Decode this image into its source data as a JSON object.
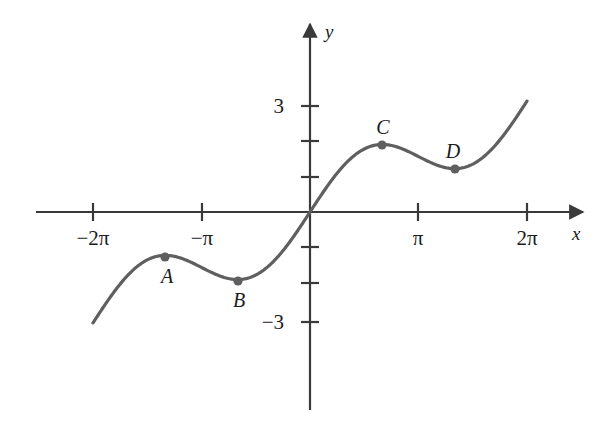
{
  "figure": {
    "kind": "math-function-graph",
    "background_color": "#ffffff",
    "curve_color": "#5f5f5f",
    "axis_color": "#3a3a3a",
    "label_color": "#1c1c1c",
    "width": 613,
    "height": 432
  },
  "axes": {
    "x_axis_label": "x",
    "y_axis_label": "y",
    "origin_px": {
      "x": 310,
      "y": 212
    },
    "px_per_pi": 108.5,
    "px_per_unit_y": 35.3,
    "x_ticks": [
      {
        "label": "−2π",
        "x_value": -6.2832,
        "x_px": 93
      },
      {
        "label": "−π",
        "x_value": -3.1416,
        "x_px": 202
      },
      {
        "label": "π",
        "x_value": 3.1416,
        "x_px": 418
      },
      {
        "label": "2π",
        "x_value": 6.2832,
        "x_px": 527
      }
    ],
    "y_ticks": [
      {
        "label": "3",
        "y_value": 3,
        "y_px": 106,
        "labeled": true
      },
      {
        "label": "",
        "y_value": 2,
        "y_px": 141,
        "labeled": false
      },
      {
        "label": "",
        "y_value": 1,
        "y_px": 177,
        "labeled": false
      },
      {
        "label": "",
        "y_value": -1,
        "y_px": 247,
        "labeled": false
      },
      {
        "label": "",
        "y_value": -2,
        "y_px": 283,
        "labeled": false
      },
      {
        "label": "−3",
        "y_value": -3,
        "y_px": 322,
        "labeled": true
      }
    ],
    "x_range_drawn": [
      -6.2832,
      6.2832
    ],
    "y_range_drawn": [
      -3.34,
      3.17
    ]
  },
  "chart_data": {
    "type": "line",
    "title": "",
    "xlabel": "x",
    "ylabel": "y",
    "grid": false,
    "legend": "none",
    "series": [
      {
        "name": "f(x) = x/2 + sin(x)",
        "expression": "x/2 + sin(x)",
        "x": [
          -6.2832,
          -5.7596,
          -5.236,
          -4.7124,
          -4.1888,
          -3.6652,
          -3.1416,
          -2.618,
          -2.0944,
          -1.5708,
          -1.0472,
          -0.5236,
          0,
          0.5236,
          1.0472,
          1.5708,
          2.0944,
          2.618,
          3.1416,
          3.6652,
          4.1888,
          4.7124,
          5.236,
          5.7596,
          6.2832
        ],
        "y": [
          -3.1416,
          -3.3798,
          -3.484,
          -3.3562,
          -3.0604,
          -2.7296,
          -1.5708,
          -1.1428,
          -1.1138,
          -1.7854,
          -1.3944,
          -0.7618,
          0,
          0.7618,
          1.3944,
          1.7854,
          1.9138,
          1.8228,
          1.5708,
          1.3296,
          1.2284,
          1.3562,
          1.684,
          2.3798,
          3.1416
        ]
      }
    ],
    "marked_points": [
      {
        "label": "A",
        "type": "local-maximum",
        "x_value": -4.1888,
        "y_value": -1.2626,
        "x_px": 165,
        "y_px": 257,
        "label_px": {
          "x": 167,
          "y": 276
        },
        "label_position": "below"
      },
      {
        "label": "B",
        "type": "local-minimum",
        "x_value": -2.0944,
        "y_value": -1.9138,
        "x_px": 238,
        "y_px": 281,
        "label_px": {
          "x": 239,
          "y": 300
        },
        "label_position": "below"
      },
      {
        "label": "C",
        "type": "local-maximum",
        "x_value": 2.0944,
        "y_value": 1.9138,
        "x_px": 382,
        "y_px": 145,
        "label_px": {
          "x": 383,
          "y": 127
        },
        "label_position": "above"
      },
      {
        "label": "D",
        "type": "local-minimum",
        "x_value": 4.1888,
        "y_value": 1.2626,
        "x_px": 455,
        "y_px": 169,
        "label_px": {
          "x": 453,
          "y": 151
        },
        "label_position": "above"
      }
    ],
    "endpoints": [
      {
        "x_px": 92,
        "y_px": 330
      },
      {
        "x_px": 527,
        "y_px": 100
      }
    ]
  }
}
